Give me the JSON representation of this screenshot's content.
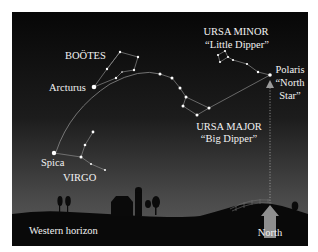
{
  "diagram": {
    "colors": {
      "sky_top": "#080808",
      "sky_bottom": "#5a5a5a",
      "ground": "#0a0a0a",
      "star": "#ffffff",
      "line": "#9a9a9a",
      "label": "#f2f2f2",
      "north_arrow": "#9c9c9c"
    },
    "labels": {
      "bootes": "BOÖTES",
      "arcturus": "Arcturus",
      "ursa_minor": "URSA MINOR",
      "little_dipper": "“Little Dipper”",
      "polaris_1": "Polaris",
      "polaris_2": "“North",
      "polaris_3": "Star”",
      "ursa_major": "URSA MAJOR",
      "big_dipper": "“Big Dipper”",
      "spica": "Spica",
      "virgo": "VIRGO",
      "western_horizon": "Western horizon",
      "north": "North"
    },
    "constellations": [
      {
        "name": "Boötes",
        "stars": [
          [
            120,
            52
          ],
          [
            138,
            57
          ],
          [
            134,
            70
          ],
          [
            122,
            72
          ],
          [
            107,
            69
          ],
          [
            116,
            78
          ]
        ]
      },
      {
        "name": "Ursa Minor",
        "stars": [
          [
            218,
            55
          ],
          [
            225,
            51
          ],
          [
            228,
            57
          ],
          [
            220,
            62
          ],
          [
            233,
            60
          ],
          [
            247,
            64
          ],
          [
            258,
            72
          ],
          [
            270,
            75
          ]
        ]
      },
      {
        "name": "Ursa Major",
        "stars": [
          [
            160,
            74
          ],
          [
            172,
            78
          ],
          [
            180,
            88
          ],
          [
            186,
            97
          ],
          [
            183,
            106
          ],
          [
            197,
            115
          ],
          [
            209,
            108
          ]
        ]
      },
      {
        "name": "Virgo",
        "stars": [
          [
            93,
            132
          ],
          [
            85,
            145
          ],
          [
            81,
            157
          ],
          [
            91,
            164
          ],
          [
            105,
            170
          ]
        ]
      }
    ],
    "named_stars": [
      {
        "name": "Arcturus",
        "pos": [
          94,
          87
        ]
      },
      {
        "name": "Polaris",
        "pos": [
          270,
          75
        ]
      },
      {
        "name": "Spica",
        "pos": [
          54,
          153
        ]
      }
    ]
  }
}
